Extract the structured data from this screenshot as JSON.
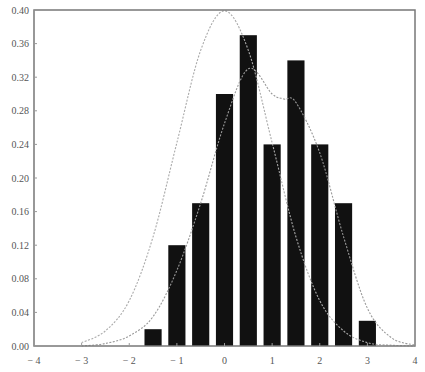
{
  "chart_data": {
    "type": "bar",
    "title": "",
    "xlabel": "",
    "ylabel": "",
    "xlim": [
      -4,
      4
    ],
    "ylim": [
      0,
      0.4
    ],
    "grid": false,
    "legend": null,
    "x_ticks": [
      -4,
      -3,
      -2,
      -1,
      0,
      1,
      2,
      3,
      4
    ],
    "x_tick_labels": [
      "-4",
      "-3",
      "-2",
      "-1",
      "0",
      "1",
      "2",
      "3",
      "4"
    ],
    "y_ticks": [
      0,
      0.04,
      0.08,
      0.12,
      0.16,
      0.2,
      0.24,
      0.28,
      0.32,
      0.36,
      0.4
    ],
    "y_tick_labels": [
      "0.00",
      "0.04",
      "0.08",
      "0.12",
      "0.16",
      "0.20",
      "0.24",
      "0.28",
      "0.32",
      "0.36",
      "0.40"
    ],
    "bar_width": 0.36,
    "series": [
      {
        "name": "histogram",
        "kind": "bar",
        "color": "#111111",
        "x": [
          -1.5,
          -1.0,
          -0.5,
          0.0,
          0.5,
          1.0,
          1.5,
          2.0,
          2.5,
          3.0
        ],
        "values": [
          0.02,
          0.12,
          0.17,
          0.3,
          0.37,
          0.24,
          0.34,
          0.24,
          0.17,
          0.03
        ]
      },
      {
        "name": "standard normal density",
        "kind": "line",
        "style": "dotted-plus-markers",
        "color": "#aaaaaa",
        "x": [
          -3.0,
          -2.5,
          -2.0,
          -1.5,
          -1.0,
          -0.5,
          0.0,
          0.5,
          1.0,
          1.5,
          2.0,
          2.5,
          3.0,
          3.5,
          4.0
        ],
        "values": [
          0.004,
          0.018,
          0.054,
          0.13,
          0.242,
          0.352,
          0.399,
          0.352,
          0.242,
          0.13,
          0.054,
          0.018,
          0.004,
          0.001,
          0.0
        ]
      },
      {
        "name": "smoothed density",
        "kind": "line",
        "style": "dotted-plus-markers",
        "color": "#999999",
        "x": [
          -3.0,
          -2.5,
          -2.0,
          -1.5,
          -1.0,
          -0.5,
          0.0,
          0.5,
          1.0,
          1.25,
          1.5,
          2.0,
          2.5,
          3.0,
          3.5,
          4.0
        ],
        "values": [
          0.0,
          0.003,
          0.012,
          0.035,
          0.09,
          0.17,
          0.265,
          0.33,
          0.3,
          0.294,
          0.29,
          0.23,
          0.13,
          0.045,
          0.01,
          0.001
        ]
      }
    ]
  }
}
